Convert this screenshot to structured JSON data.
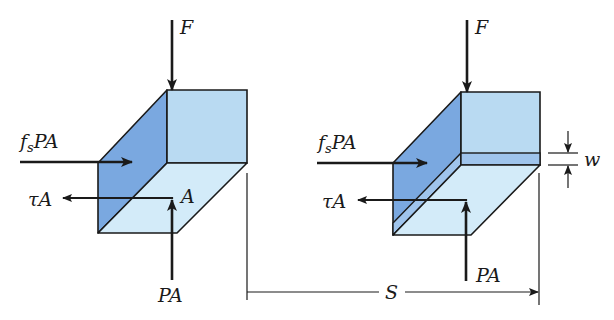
{
  "diagram": {
    "colors": {
      "dark_face": "#7aa8e0",
      "light_face": "#b9daf2",
      "bottom_face": "#d3ebf9",
      "stripe": "#9fc4ec",
      "stroke": "#1a1a1a"
    },
    "left_block": {
      "force_top": "F",
      "force_friction_main": "f",
      "force_friction_sub": "s",
      "force_friction_rest": "PA",
      "force_shear": "τA",
      "area_label": "A",
      "force_bottom": "PA"
    },
    "right_block": {
      "force_top": "F",
      "force_friction_main": "f",
      "force_friction_sub": "s",
      "force_friction_rest": "PA",
      "force_shear": "τA",
      "force_bottom": "PA",
      "width_label": "w"
    },
    "dimension": {
      "label": "S"
    }
  }
}
